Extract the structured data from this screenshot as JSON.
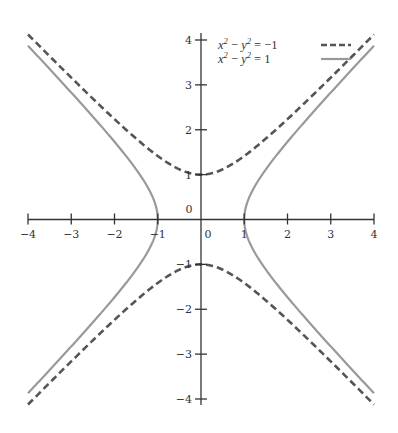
{
  "chart_data": {
    "type": "line",
    "title": "",
    "xlabel": "",
    "ylabel": "",
    "xlim": [
      -4,
      4
    ],
    "ylim": [
      -4,
      4
    ],
    "grid": false,
    "legend_position": "upper center (right of y-axis)",
    "x_ticks": [
      -4,
      -3,
      -2,
      -1,
      0,
      1,
      2,
      3,
      4
    ],
    "y_ticks": [
      -4,
      -3,
      -2,
      -1,
      0,
      1,
      2,
      3,
      4
    ],
    "x_tick_labels": [
      "−4",
      "−3",
      "−2",
      "−1",
      "0",
      "1",
      "2",
      "3",
      "4"
    ],
    "y_tick_labels": [
      "−4",
      "−3",
      "−2",
      "−1",
      "0",
      "1",
      "2",
      "3",
      "4"
    ],
    "series": [
      {
        "name": "x² − y² = −1",
        "style": "dashed",
        "color": "#555555",
        "equation": "y = ±sqrt(x^2 + 1)",
        "branches": [
          {
            "x": [
              -4,
              -3,
              -2,
              -1,
              0,
              1,
              2,
              3,
              4
            ],
            "y": [
              4.12,
              3.16,
              2.24,
              1.41,
              1,
              1.41,
              2.24,
              3.16,
              4.12
            ]
          },
          {
            "x": [
              -4,
              -3,
              -2,
              -1,
              0,
              1,
              2,
              3,
              4
            ],
            "y": [
              -4.12,
              -3.16,
              -2.24,
              -1.41,
              -1,
              -1.41,
              -2.24,
              -3.16,
              -4.12
            ]
          }
        ]
      },
      {
        "name": "x² − y² = 1",
        "style": "solid",
        "color": "#999999",
        "equation": "x = ±sqrt(y^2 + 1)",
        "branches": [
          {
            "y": [
              -3.87,
              -3,
              -2,
              -1,
              0,
              1,
              2,
              3,
              3.87
            ],
            "x": [
              4,
              3.16,
              2.24,
              1.41,
              1,
              1.41,
              2.24,
              3.16,
              4
            ]
          },
          {
            "y": [
              -3.87,
              -3,
              -2,
              -1,
              0,
              1,
              2,
              3,
              3.87
            ],
            "x": [
              -4,
              -3.16,
              -2.24,
              -1.41,
              -1,
              -1.41,
              -2.24,
              -3.16,
              -4
            ]
          }
        ]
      }
    ]
  },
  "legend": {
    "items": [
      {
        "label_left": "x",
        "label_mid": "2",
        "label_minus": " − ",
        "label_y": "y",
        "label_sup": "2",
        "label_rhs": " = −1"
      },
      {
        "label_left": "x",
        "label_mid": "2",
        "label_minus": " − ",
        "label_y": "y",
        "label_sup": "2",
        "label_rhs": " = 1"
      }
    ]
  },
  "axes": {
    "x_zero_label": "0",
    "y_zero_label": "0"
  }
}
